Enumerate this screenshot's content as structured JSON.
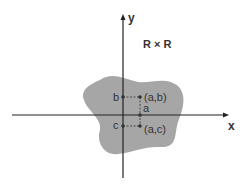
{
  "title": "R × R",
  "axes": {
    "x_label": "x",
    "y_label": "y"
  },
  "points": {
    "b_label": "b",
    "ab_label": "(a,b)",
    "a_label": "a",
    "c_label": "c",
    "ac_label": "(a,c)"
  },
  "colors": {
    "region": "#a6a6a6",
    "axis": "#222222",
    "point": "#333333"
  }
}
